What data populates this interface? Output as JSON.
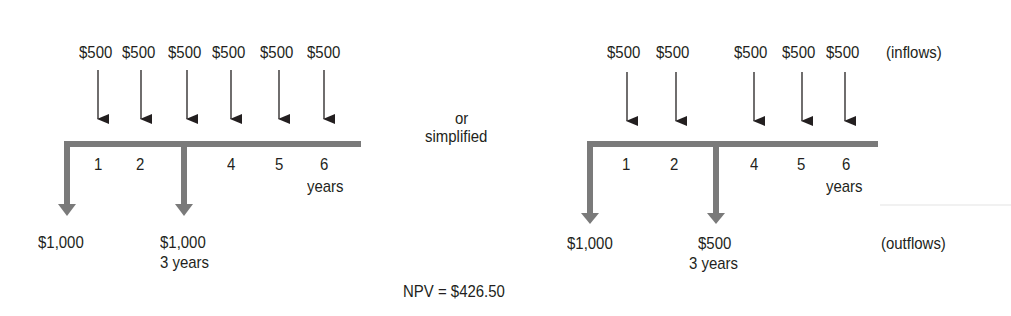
{
  "left_diagram": {
    "inflows": [
      {
        "year": 1,
        "label": "$500"
      },
      {
        "year": 2,
        "label": "$500"
      },
      {
        "year": 3,
        "label": "$500"
      },
      {
        "year": 4,
        "label": "$500"
      },
      {
        "year": 5,
        "label": "$500"
      },
      {
        "year": 6,
        "label": "$500"
      }
    ],
    "ticks": [
      "1",
      "2",
      "4",
      "5",
      "6"
    ],
    "axis_unit": "years",
    "outflows": [
      {
        "year": 0,
        "label": "$1,000"
      },
      {
        "year": 3,
        "label": "$1,000",
        "sublabel": "3 years"
      }
    ]
  },
  "connector": {
    "line1": "or",
    "line2": "simplified"
  },
  "right_diagram": {
    "inflows": [
      {
        "year": 1,
        "label": "$500"
      },
      {
        "year": 2,
        "label": "$500"
      },
      {
        "year": 4,
        "label": "$500"
      },
      {
        "year": 5,
        "label": "$500"
      },
      {
        "year": 6,
        "label": "$500"
      }
    ],
    "inflows_caption": "(inflows)",
    "ticks": [
      "1",
      "2",
      "4",
      "5",
      "6"
    ],
    "axis_unit": "years",
    "outflows": [
      {
        "year": 0,
        "label": "$1,000"
      },
      {
        "year": 3,
        "label": "$500",
        "sublabel": "3 years"
      }
    ],
    "outflows_caption": "(outflows)"
  },
  "npv": "NPV = $426.50",
  "colors": {
    "axis": "#7a7a7a",
    "arrow": "#231f20",
    "text": "#231f20"
  }
}
